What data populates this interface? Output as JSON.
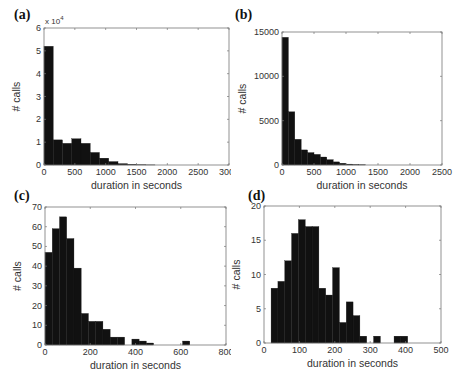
{
  "figure": {
    "panels": [
      {
        "id": "a",
        "label": "(a)"
      },
      {
        "id": "b",
        "label": "(b)"
      },
      {
        "id": "c",
        "label": "(c)"
      },
      {
        "id": "d",
        "label": "(d)"
      }
    ]
  },
  "chart_data": [
    {
      "panel": "(a)",
      "type": "bar",
      "title": "",
      "xlabel": "duration in seconds",
      "ylabel": "# calls",
      "y_multiplier": "x 10^4",
      "xlim": [
        0,
        3000
      ],
      "ylim": [
        0,
        6
      ],
      "xticks": [
        0,
        500,
        1000,
        1500,
        2000,
        2500,
        3000
      ],
      "yticks": [
        0,
        1,
        2,
        3,
        4,
        5,
        6
      ],
      "bin_width": 150,
      "bin_starts": [
        0,
        150,
        300,
        450,
        600,
        750,
        900,
        1050,
        1200,
        1350,
        1500,
        1650
      ],
      "values": [
        5.2,
        1.1,
        0.95,
        1.15,
        0.95,
        0.55,
        0.3,
        0.15,
        0.06,
        0.03,
        0.01,
        0.005
      ]
    },
    {
      "panel": "(b)",
      "type": "bar",
      "title": "",
      "xlabel": "duration in seconds",
      "ylabel": "# calls",
      "xlim": [
        0,
        2500
      ],
      "ylim": [
        0,
        15000
      ],
      "xticks": [
        0,
        500,
        1000,
        1500,
        2000,
        2500
      ],
      "yticks": [
        0,
        5000,
        10000,
        15000
      ],
      "bin_width": 100,
      "bin_starts": [
        0,
        100,
        200,
        300,
        400,
        500,
        600,
        700,
        800,
        900,
        1000,
        1100,
        1200
      ],
      "values": [
        14400,
        6000,
        2900,
        1700,
        1400,
        1200,
        900,
        600,
        350,
        200,
        100,
        50,
        20
      ]
    },
    {
      "panel": "(c)",
      "type": "bar",
      "title": "",
      "xlabel": "duration in seconds",
      "ylabel": "# calls",
      "xlim": [
        0,
        800
      ],
      "ylim": [
        0,
        70
      ],
      "xticks": [
        0,
        200,
        400,
        600,
        800
      ],
      "yticks": [
        0,
        10,
        20,
        30,
        40,
        50,
        60,
        70
      ],
      "bin_width": 32,
      "bin_starts": [
        0,
        32,
        64,
        96,
        128,
        160,
        192,
        224,
        256,
        288,
        320,
        352,
        384,
        416,
        448,
        480,
        512,
        544,
        576,
        608
      ],
      "values": [
        47,
        59,
        65,
        54,
        39,
        16,
        12,
        12,
        8,
        4,
        4,
        0,
        3,
        2,
        1,
        0,
        0,
        0,
        0,
        2
      ]
    },
    {
      "panel": "(d)",
      "type": "bar",
      "title": "",
      "xlabel": "duration in seconds",
      "ylabel": "# calls",
      "xlim": [
        0,
        500
      ],
      "ylim": [
        0,
        20
      ],
      "xticks": [
        0,
        100,
        200,
        300,
        400,
        500
      ],
      "yticks": [
        0,
        5,
        10,
        15,
        20
      ],
      "bin_width": 19.3,
      "bin_starts": [
        20,
        39.3,
        58.6,
        77.9,
        97.2,
        116.5,
        135.8,
        155.1,
        174.4,
        193.7,
        213,
        232.3,
        251.6,
        270.9,
        290.2,
        309.5,
        328.8,
        348.1,
        367.4,
        386.7
      ],
      "values": [
        8,
        9,
        12,
        16,
        18,
        17,
        17,
        8,
        7,
        11,
        3,
        6,
        4,
        1,
        0,
        1,
        0,
        0,
        1,
        1
      ]
    }
  ]
}
